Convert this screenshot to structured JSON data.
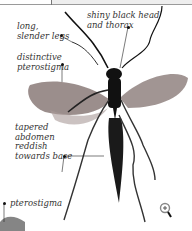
{
  "labels": {
    "legs": "long,\nslender legs",
    "pterostigma_top": "distinctive\npterostigma",
    "head": "shiny black head\nand thorax",
    "abdomen": "tapered\nabdomen\nreddish\ntowards base",
    "pterostigma_bottom": "pterostigma"
  },
  "controls": {
    "zoom_icon": "magnifier-plus"
  },
  "colors": {
    "body": "#111111",
    "wing": "#8a7a78",
    "text": "#333333"
  }
}
